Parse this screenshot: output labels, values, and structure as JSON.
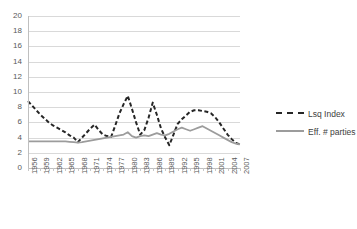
{
  "chart_data": {
    "type": "line",
    "title": "",
    "subtitle": "",
    "xlabel": "",
    "ylabel": "",
    "ylim": [
      0,
      20
    ],
    "ytick_values": [
      0,
      2,
      4,
      6,
      8,
      10,
      12,
      14,
      16,
      18,
      20
    ],
    "grid": true,
    "legend_position": "right",
    "x": [
      1956,
      1957,
      1958,
      1959,
      1960,
      1961,
      1962,
      1963,
      1964,
      1965,
      1966,
      1967,
      1968,
      1969,
      1970,
      1971,
      1972,
      1973,
      1974,
      1975,
      1976,
      1977,
      1978,
      1979,
      1980,
      1981,
      1982,
      1983,
      1984,
      1985,
      1986,
      1987,
      1988,
      1989,
      1990,
      1991,
      1992,
      1993,
      1994,
      1995,
      1996,
      1997,
      1998,
      1999,
      2000,
      2001,
      2002,
      2003,
      2004,
      2005,
      2006,
      2007
    ],
    "xtick_labels": [
      "1956",
      "1959",
      "1962",
      "1965",
      "1968",
      "1971",
      "1974",
      "1977",
      "1980",
      "1983",
      "1986",
      "1989",
      "1992",
      "1995",
      "1998",
      "2001",
      "2004",
      "2007"
    ],
    "series": [
      {
        "name": "Lsq Index",
        "style": "dashed",
        "color": "#262626",
        "values": [
          8.8,
          8.2,
          7.6,
          7.0,
          6.5,
          6.0,
          5.6,
          5.3,
          5.0,
          4.7,
          4.3,
          4.0,
          3.4,
          4.0,
          4.6,
          5.2,
          5.7,
          5.0,
          4.4,
          4.2,
          4.1,
          5.6,
          7.2,
          8.4,
          9.5,
          7.8,
          6.0,
          4.4,
          5.0,
          6.6,
          8.6,
          7.0,
          5.2,
          4.0,
          3.0,
          4.4,
          5.8,
          6.4,
          6.9,
          7.4,
          7.6,
          7.6,
          7.5,
          7.4,
          7.2,
          6.7,
          6.0,
          5.2,
          4.4,
          3.8,
          3.3,
          3.1
        ]
      },
      {
        "name": "Eff. # parties",
        "style": "solid",
        "color": "#9c9c9c",
        "values": [
          3.5,
          3.5,
          3.5,
          3.5,
          3.5,
          3.5,
          3.5,
          3.5,
          3.5,
          3.5,
          3.45,
          3.4,
          3.35,
          3.4,
          3.5,
          3.6,
          3.7,
          3.8,
          3.9,
          4.0,
          4.1,
          4.2,
          4.3,
          4.4,
          4.7,
          4.2,
          4.0,
          4.2,
          4.3,
          4.2,
          4.4,
          4.6,
          4.4,
          4.3,
          4.5,
          4.8,
          5.1,
          5.3,
          5.1,
          4.9,
          5.1,
          5.3,
          5.5,
          5.2,
          4.9,
          4.6,
          4.3,
          4.0,
          3.7,
          3.4,
          3.2,
          3.1
        ]
      }
    ]
  },
  "legend": {
    "items": [
      {
        "label": "Lsq Index"
      },
      {
        "label": "Eff. # parties"
      }
    ]
  }
}
